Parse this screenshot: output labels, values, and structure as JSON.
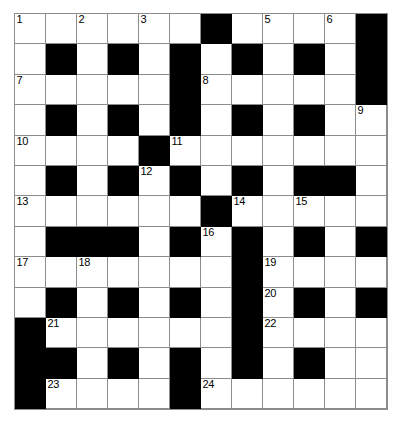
{
  "puzzle": {
    "type": "crossword-grid",
    "rows": 13,
    "cols": 12,
    "cell_size_px": 31,
    "colors": {
      "block": "#000000",
      "empty": "#ffffff",
      "grid_line": "#8c8c8c",
      "number": "#000000"
    },
    "legend": {
      "0": "white (fillable cell)",
      "1": "black (blocked cell)"
    },
    "grid": [
      [
        0,
        0,
        0,
        0,
        0,
        0,
        1,
        0,
        0,
        0,
        0,
        1
      ],
      [
        0,
        1,
        0,
        1,
        0,
        1,
        0,
        1,
        0,
        1,
        0,
        1
      ],
      [
        0,
        0,
        0,
        0,
        0,
        1,
        0,
        0,
        0,
        0,
        0,
        1
      ],
      [
        0,
        1,
        0,
        1,
        0,
        1,
        0,
        1,
        0,
        1,
        0,
        0
      ],
      [
        0,
        0,
        0,
        0,
        1,
        0,
        0,
        0,
        0,
        0,
        0,
        0
      ],
      [
        0,
        1,
        0,
        1,
        0,
        1,
        0,
        1,
        0,
        1,
        1,
        0
      ],
      [
        0,
        0,
        0,
        0,
        0,
        0,
        1,
        0,
        0,
        0,
        0,
        0
      ],
      [
        0,
        1,
        1,
        1,
        0,
        1,
        0,
        1,
        0,
        1,
        0,
        1
      ],
      [
        0,
        0,
        0,
        0,
        0,
        0,
        0,
        1,
        0,
        0,
        0,
        0
      ],
      [
        0,
        1,
        0,
        1,
        0,
        1,
        0,
        1,
        0,
        1,
        0,
        1
      ],
      [
        1,
        0,
        0,
        0,
        0,
        0,
        0,
        1,
        0,
        0,
        0,
        0
      ],
      [
        1,
        1,
        0,
        1,
        0,
        1,
        0,
        1,
        0,
        1,
        0,
        0
      ],
      [
        1,
        0,
        0,
        0,
        0,
        1,
        0,
        0,
        0,
        0,
        0,
        0
      ]
    ],
    "numbers": [
      {
        "n": "1",
        "row": 0,
        "col": 0
      },
      {
        "n": "2",
        "row": 0,
        "col": 2
      },
      {
        "n": "3",
        "row": 0,
        "col": 4
      },
      {
        "n": "4",
        "row": 0,
        "col": 6
      },
      {
        "n": "5",
        "row": 0,
        "col": 8
      },
      {
        "n": "6",
        "row": 0,
        "col": 10
      },
      {
        "n": "7",
        "row": 2,
        "col": 0
      },
      {
        "n": "8",
        "row": 2,
        "col": 6
      },
      {
        "n": "9",
        "row": 3,
        "col": 11
      },
      {
        "n": "10",
        "row": 4,
        "col": 0
      },
      {
        "n": "11",
        "row": 4,
        "col": 5
      },
      {
        "n": "12",
        "row": 5,
        "col": 4
      },
      {
        "n": "13",
        "row": 6,
        "col": 0
      },
      {
        "n": "14",
        "row": 6,
        "col": 7
      },
      {
        "n": "15",
        "row": 6,
        "col": 9
      },
      {
        "n": "16",
        "row": 7,
        "col": 6
      },
      {
        "n": "17",
        "row": 8,
        "col": 0
      },
      {
        "n": "18",
        "row": 8,
        "col": 2
      },
      {
        "n": "19",
        "row": 8,
        "col": 8
      },
      {
        "n": "20",
        "row": 9,
        "col": 8
      },
      {
        "n": "21",
        "row": 10,
        "col": 1
      },
      {
        "n": "22",
        "row": 10,
        "col": 8
      },
      {
        "n": "23",
        "row": 12,
        "col": 1
      },
      {
        "n": "24",
        "row": 12,
        "col": 6
      }
    ]
  }
}
